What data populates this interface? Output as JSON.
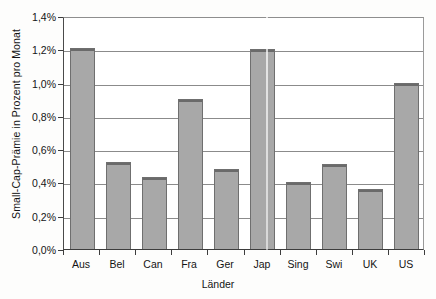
{
  "chart_data": {
    "type": "bar",
    "title": "",
    "xlabel": "Länder",
    "ylabel": "Small-Cap-Prämie in Prozent pro Monat",
    "categories": [
      "Aus",
      "Bel",
      "Can",
      "Fra",
      "Ger",
      "Jap",
      "Sing",
      "Swi",
      "UK",
      "US"
    ],
    "values": [
      1.21,
      0.52,
      0.43,
      0.9,
      0.48,
      1.2,
      0.4,
      0.51,
      0.36,
      1.0
    ],
    "ylim": [
      0.0,
      1.4
    ],
    "ytick_values": [
      0.0,
      0.2,
      0.4,
      0.6,
      0.8,
      1.0,
      1.2,
      1.4
    ],
    "ytick_labels": [
      "0,0%",
      "0,2%",
      "0,4%",
      "0,6%",
      "0,8%",
      "1,0%",
      "1,2%",
      "1,4%"
    ],
    "grid": "horizontal",
    "legend": "none",
    "bar_color": "#a8a8a8",
    "bar_edge_color": "#6f6f6f",
    "axis_color": "#3d3d3d",
    "grid_color": "#8b8b8b"
  }
}
